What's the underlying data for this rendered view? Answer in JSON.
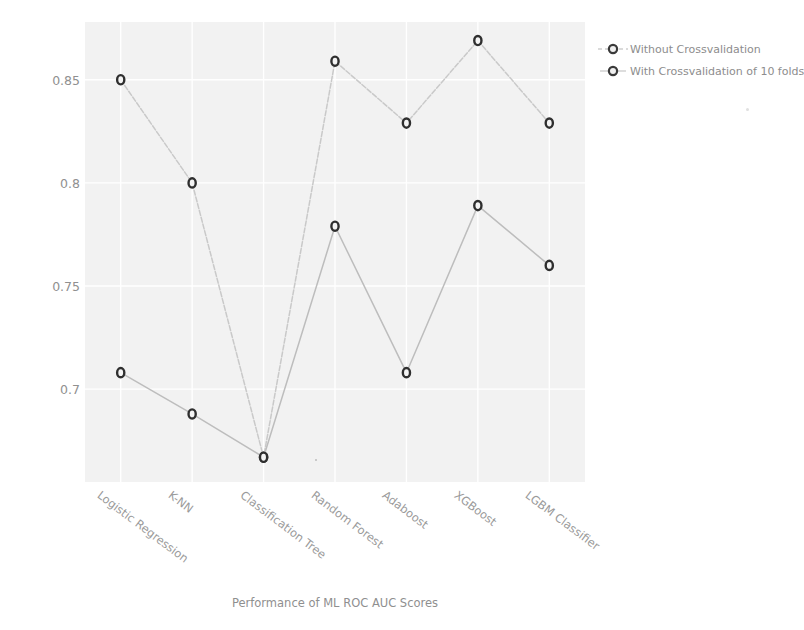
{
  "chart_data": {
    "type": "line",
    "title": "",
    "xlabel": "Performance of ML ROC AUC Scores",
    "ylabel": "ROC AUC Scores",
    "categories": [
      "Logistic Regression",
      "K-NN",
      "Classification Tree",
      "Random Forest",
      "Adaboost",
      "XGBoost",
      "LGBM Classifier"
    ],
    "series": [
      {
        "name": "Without Crossvalidation",
        "values": [
          0.85,
          0.8,
          0.667,
          0.859,
          0.829,
          0.869,
          0.829
        ],
        "color": "#c9c9c9",
        "marker": "circle",
        "linestyle": "dashed"
      },
      {
        "name": "With Crossvalidation of 10 folds",
        "values": [
          0.708,
          0.688,
          0.667,
          0.779,
          0.708,
          0.789,
          0.76
        ],
        "color": "#bdbdbd",
        "marker": "circle",
        "linestyle": "solid"
      }
    ],
    "yticks": [
      0.7,
      0.75,
      0.8,
      0.85
    ],
    "ytick_labels": [
      "0.7",
      "0.75",
      "0.8",
      "0.85"
    ],
    "ylim": [
      0.655,
      0.878
    ],
    "grid": true,
    "legend_position": "right-top",
    "plot_background": "#f2f2f2"
  },
  "legend": {
    "entries": [
      {
        "label": "Without Crossvalidation"
      },
      {
        "label": "With Crossvalidation of 10 folds"
      }
    ]
  }
}
